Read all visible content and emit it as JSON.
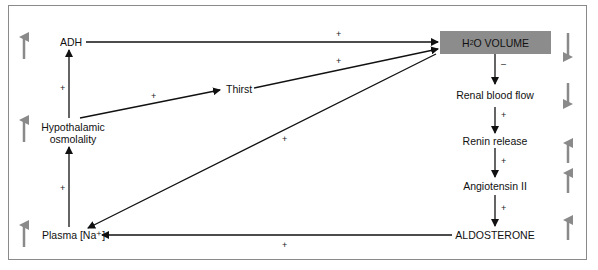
{
  "diagram": {
    "nodes": {
      "adh": "ADH",
      "hypothalamic_osmolality_line1": "Hypothalamic",
      "hypothalamic_osmolality_line2": "osmolality",
      "plasma_na": "Plasma [Na⁺]",
      "thirst": "Thirst",
      "h2o_volume_pre": "H",
      "h2o_volume_sub": "2",
      "h2o_volume_post": "O VOLUME",
      "renal_blood_flow": "Renal blood flow",
      "renin_release": "Renin release",
      "angiotensin_ii": "Angiotensin II",
      "aldosterone": "ALDOSTERONE"
    },
    "edge_signs": {
      "adh_to_h2o": "+",
      "thirst_to_h2o": "+",
      "hypo_to_thirst": "+",
      "hypo_to_adh": "+",
      "plasma_to_hypo": "+",
      "h2o_to_plasma": "+",
      "aldo_to_plasma": "+",
      "h2o_to_renal": "–",
      "renal_to_renin": "+",
      "renin_to_angio": "+",
      "angio_to_aldo": "+"
    },
    "indicators": {
      "adh": "up",
      "hypothalamic_osmolality": "up",
      "plasma_na": "up",
      "h2o_volume": "down",
      "renal_blood_flow": "down",
      "renin_release": "up",
      "angiotensin_ii": "up",
      "aldosterone": "up"
    },
    "colors": {
      "box_fill": "#8c8c8c",
      "indicator_arrow": "#8a8a8a",
      "line": "#111111",
      "frame": "#8a8a8a"
    }
  }
}
